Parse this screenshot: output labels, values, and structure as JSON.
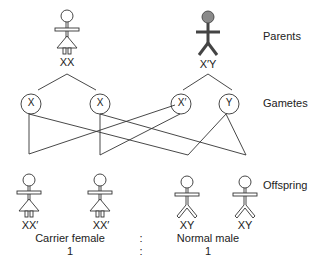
{
  "diagram": {
    "type": "inheritance-cross",
    "row_labels": {
      "parents": "Parents",
      "gametes": "Gametes",
      "offspring": "Offspring"
    },
    "parents": [
      {
        "sex": "female",
        "genotype": "XX",
        "shaded": false
      },
      {
        "sex": "male",
        "genotype": "X′Y",
        "shaded": true
      }
    ],
    "gametes": [
      {
        "label": "X",
        "from": "female"
      },
      {
        "label": "X",
        "from": "female"
      },
      {
        "label": "X′",
        "from": "male"
      },
      {
        "label": "Y",
        "from": "male"
      }
    ],
    "offspring": [
      {
        "sex": "female",
        "genotype": "XX′"
      },
      {
        "sex": "female",
        "genotype": "XX′"
      },
      {
        "sex": "male",
        "genotype": "XY"
      },
      {
        "sex": "male",
        "genotype": "XY"
      }
    ],
    "summary": {
      "left_label": "Carrier female",
      "separator": ":",
      "right_label": "Normal male",
      "left_ratio": "1",
      "right_ratio": "1"
    },
    "colors": {
      "line": "#333333",
      "affected_fill": "#8a8a8a"
    }
  }
}
